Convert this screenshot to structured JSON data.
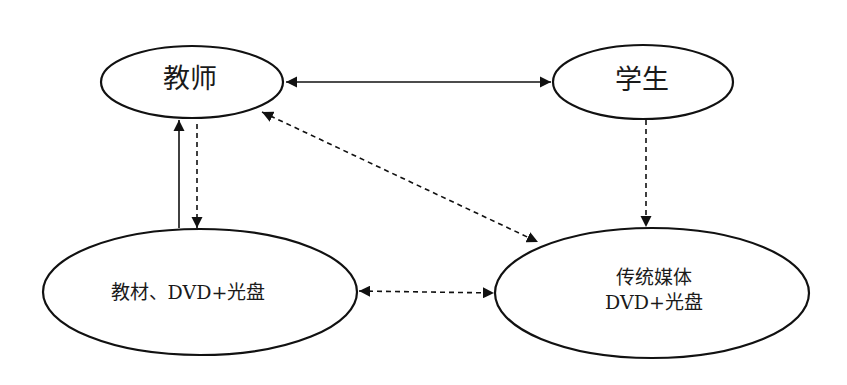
{
  "diagram": {
    "nodes": [
      {
        "id": "teacher",
        "label": "教师"
      },
      {
        "id": "student",
        "label": "学生"
      },
      {
        "id": "materials",
        "label": "教材、DVD+光盘"
      },
      {
        "id": "traditional_media",
        "label_line1": "传统媒体",
        "label_line2": "DVD+光盘"
      }
    ],
    "edges": [
      {
        "from": "teacher",
        "to": "student",
        "style": "solid",
        "direction": "both"
      },
      {
        "from": "materials",
        "to": "teacher",
        "style": "solid",
        "direction": "forward"
      },
      {
        "from": "teacher",
        "to": "materials",
        "style": "dashed",
        "direction": "forward"
      },
      {
        "from": "teacher",
        "to": "traditional_media",
        "style": "dashed",
        "direction": "both"
      },
      {
        "from": "student",
        "to": "traditional_media",
        "style": "dashed",
        "direction": "forward"
      },
      {
        "from": "materials",
        "to": "traditional_media",
        "style": "dashed",
        "direction": "both"
      }
    ],
    "colors": {
      "stroke": "#111111",
      "background": "#ffffff"
    }
  }
}
